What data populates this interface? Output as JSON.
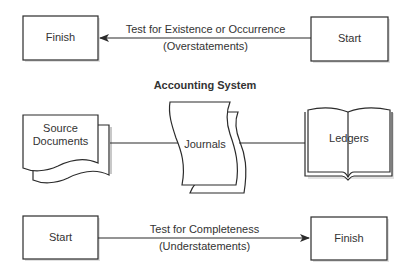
{
  "diagram": {
    "title": "Accounting System",
    "top_flow": {
      "left_box": "Finish",
      "right_box": "Start",
      "arrow_direction": "right-to-left",
      "label_above": "Test for Existence or Occurrence",
      "label_below": "(Overstatements)"
    },
    "system": {
      "source": {
        "label_line1": "Source",
        "label_line2": "Documents",
        "shape": "multi-document"
      },
      "journals": {
        "label": "Journals",
        "shape": "stacked-pages"
      },
      "ledgers": {
        "label": "Ledgers",
        "shape": "open-book"
      }
    },
    "bottom_flow": {
      "left_box": "Start",
      "right_box": "Finish",
      "arrow_direction": "left-to-right",
      "label_above": "Test for Completeness",
      "label_below": "(Understatements)"
    },
    "colors": {
      "stroke": "#2b2b2b",
      "shadow": "#bdbdbd",
      "background": "#ffffff"
    }
  }
}
